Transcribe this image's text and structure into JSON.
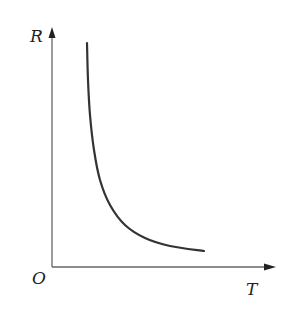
{
  "chart_data": {
    "type": "line",
    "title": "",
    "xlabel": "T",
    "ylabel": "R",
    "origin_label": "O",
    "grid": false,
    "legend": null,
    "ticks": {
      "x": [],
      "y": []
    },
    "series": [
      {
        "name": "R vs T",
        "description": "Decreasing convex curve (inverse-proportional shape); R falls steeply at small T and levels off at large T",
        "points_px": [
          [
            87,
            43
          ],
          [
            88,
            80
          ],
          [
            90,
            115
          ],
          [
            94,
            150
          ],
          [
            100,
            180
          ],
          [
            110,
            205
          ],
          [
            125,
            225
          ],
          [
            145,
            238
          ],
          [
            170,
            246
          ],
          [
            204,
            251
          ]
        ]
      }
    ],
    "colors": {
      "axis": "#555555",
      "curve": "#333333",
      "text": "#222222"
    }
  }
}
